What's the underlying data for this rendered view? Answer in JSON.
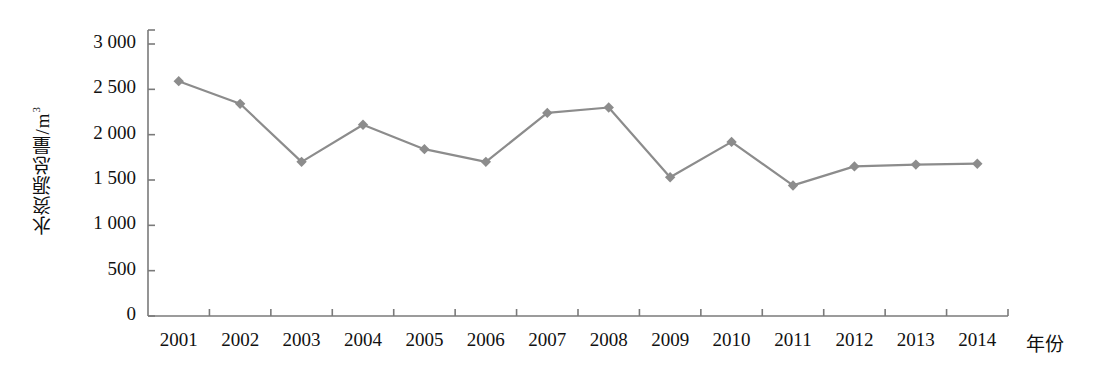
{
  "chart_data": {
    "type": "line",
    "title": "",
    "subtitle": "",
    "xlabel": "年份",
    "ylabel": "水资源总量/m",
    "ylabel_exponent": "3",
    "categories": [
      "2001",
      "2002",
      "2003",
      "2004",
      "2005",
      "2006",
      "2007",
      "2008",
      "2009",
      "2010",
      "2011",
      "2012",
      "2013",
      "2014"
    ],
    "values": [
      2590,
      2340,
      1700,
      2110,
      1840,
      1700,
      2240,
      2300,
      1530,
      1920,
      1440,
      1650,
      1670,
      1680
    ],
    "series": [
      {
        "name": "水资源总量",
        "values": [
          2590,
          2340,
          1700,
          2110,
          1840,
          1700,
          2240,
          2300,
          1530,
          1920,
          1440,
          1650,
          1670,
          1680
        ]
      }
    ],
    "ylim": [
      0,
      3000
    ],
    "yticks": [
      0,
      500,
      1000,
      1500,
      2000,
      2500,
      3000
    ],
    "ytick_labels": [
      "0",
      "500",
      "1 000",
      "1 500",
      "2 000",
      "2 500",
      "3 000"
    ],
    "grid": false,
    "legend": "none",
    "marker": "diamond",
    "line_color": "#8c8c8c",
    "marker_color": "#8c8c8c",
    "axis_color": "#7a7a7a",
    "text_color": "#111111"
  },
  "axes": {
    "plot_left": 148,
    "plot_right": 1008,
    "plot_top": 30,
    "baseline_y": 316,
    "value_top_y": 44
  }
}
